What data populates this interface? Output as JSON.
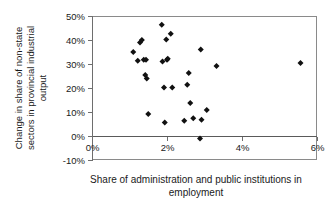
{
  "chart_data": {
    "type": "scatter",
    "title": "",
    "subtitle": "",
    "xlabel": "Share of administration and public institutions in employment",
    "ylabel": "Change in share of non-state sectors in provincial industrial output",
    "xlabel_line1": "Share of administration and public institutions in",
    "xlabel_line2": "employment",
    "ylabel_line1": "Change in share of non-state",
    "ylabel_line2": "sectors in provincial industrial",
    "ylabel_line3": "output",
    "xlim": [
      0,
      6
    ],
    "ylim": [
      -10,
      50
    ],
    "x_unit": "%",
    "y_unit": "%",
    "grid": false,
    "legend": false,
    "legend_position": "none",
    "marker_style": "filled-diamond",
    "marker_color": "#111111",
    "xticks": [
      0,
      2,
      4,
      6
    ],
    "xtick_labels": [
      "0%",
      "2%",
      "4%",
      "6%"
    ],
    "yticks": [
      -10,
      0,
      10,
      20,
      30,
      40,
      50
    ],
    "ytick_labels": [
      "-10%",
      "0%",
      "10%",
      "20%",
      "30%",
      "40%",
      "50%"
    ],
    "n_points": 28,
    "points": [
      {
        "x": 1.1,
        "y": 35.0
      },
      {
        "x": 1.22,
        "y": 31.4
      },
      {
        "x": 1.28,
        "y": 39.0
      },
      {
        "x": 1.33,
        "y": 40.0
      },
      {
        "x": 1.38,
        "y": 31.8
      },
      {
        "x": 1.44,
        "y": 31.8
      },
      {
        "x": 1.42,
        "y": 25.4
      },
      {
        "x": 1.46,
        "y": 24.0
      },
      {
        "x": 1.5,
        "y": 9.2
      },
      {
        "x": 1.86,
        "y": 46.4
      },
      {
        "x": 1.88,
        "y": 31.0
      },
      {
        "x": 1.92,
        "y": 20.2
      },
      {
        "x": 1.94,
        "y": 5.6
      },
      {
        "x": 1.98,
        "y": 40.2
      },
      {
        "x": 2.0,
        "y": 31.8
      },
      {
        "x": 2.02,
        "y": 32.2
      },
      {
        "x": 2.1,
        "y": 42.6
      },
      {
        "x": 2.14,
        "y": 20.2
      },
      {
        "x": 2.46,
        "y": 6.4
      },
      {
        "x": 2.54,
        "y": 21.4
      },
      {
        "x": 2.58,
        "y": 26.2
      },
      {
        "x": 2.62,
        "y": 13.8
      },
      {
        "x": 2.7,
        "y": 7.4
      },
      {
        "x": 2.88,
        "y": -1.0
      },
      {
        "x": 2.92,
        "y": 6.8
      },
      {
        "x": 2.9,
        "y": 36.0
      },
      {
        "x": 3.06,
        "y": 10.8
      },
      {
        "x": 3.32,
        "y": 29.2
      },
      {
        "x": 5.56,
        "y": 30.4
      }
    ]
  },
  "geometry": {
    "plot_left": 92,
    "plot_right": 317,
    "plot_top": 16,
    "plot_bottom": 160,
    "zero_y": 136
  }
}
